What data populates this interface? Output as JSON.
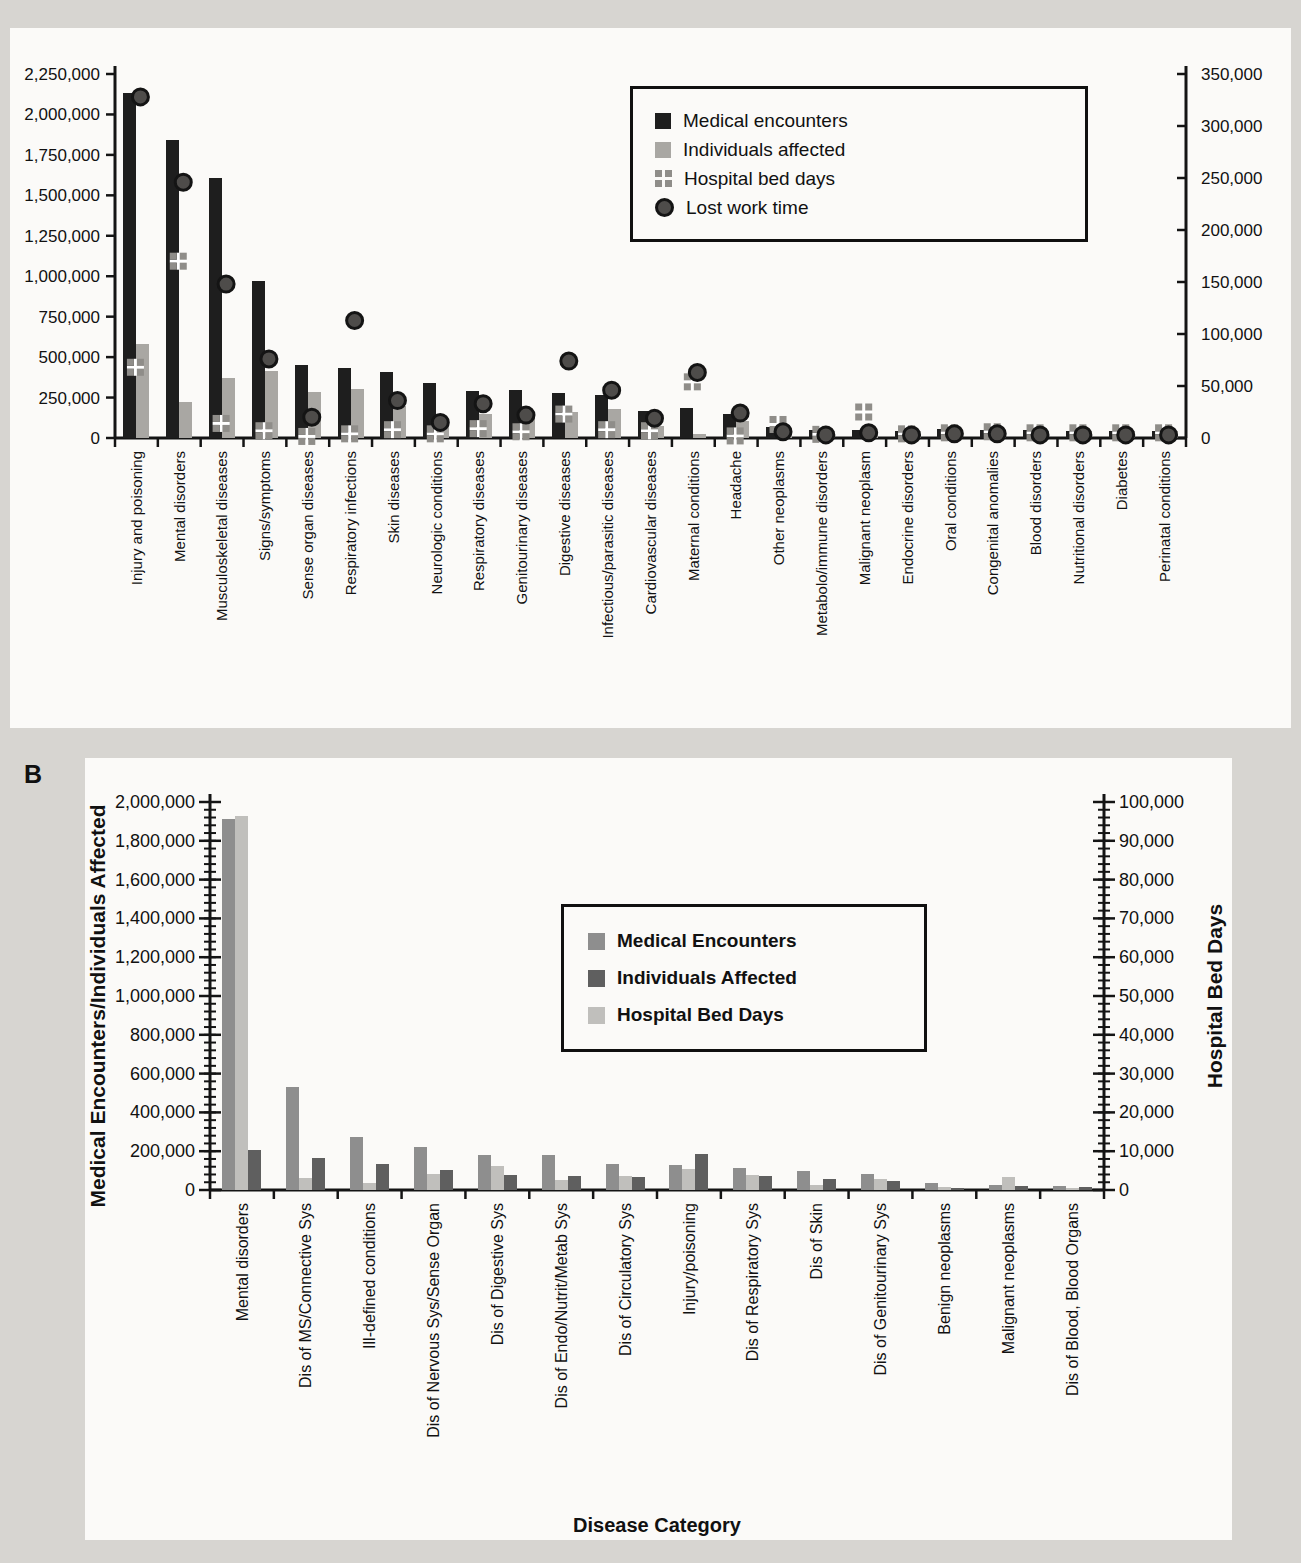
{
  "panels": {
    "a": {
      "label": "A"
    },
    "b": {
      "label": "B"
    }
  },
  "chart_data": [
    {
      "type": "bar",
      "panel": "A",
      "title": "",
      "categories": [
        "Injury and poisoning",
        "Mental disorders",
        "Musculoskeletal diseases",
        "Signs/symptoms",
        "Sense organ diseases",
        "Respiratory infections",
        "Skin diseases",
        "Neurologic conditions",
        "Respiratory diseases",
        "Genitourinary diseases",
        "Digestive diseases",
        "Infectious/parasitic diseases",
        "Cardiovascular diseases",
        "Maternal conditions",
        "Headache",
        "Other neoplasms",
        "Metabolo/immune disorders",
        "Malignant neoplasm",
        "Endocrine disorders",
        "Oral conditions",
        "Congenital anomalies",
        "Blood disorders",
        "Nutritional disorders",
        "Diabetes",
        "Perinatal conditions"
      ],
      "series": [
        {
          "name": "Medical encounters",
          "render": "bar",
          "axis": "left",
          "color": "#1e1e1e",
          "values": [
            2130000,
            1840000,
            1610000,
            970000,
            450000,
            435000,
            410000,
            340000,
            290000,
            295000,
            280000,
            265000,
            165000,
            185000,
            150000,
            70000,
            48000,
            52000,
            46000,
            56000,
            50000,
            52000,
            46000,
            46000,
            46000
          ]
        },
        {
          "name": "Individuals affected",
          "render": "bar",
          "axis": "left",
          "color": "#a9a7a3",
          "values": [
            580000,
            220000,
            372000,
            415000,
            282000,
            300000,
            195000,
            90000,
            150000,
            130000,
            160000,
            182000,
            76000,
            26000,
            103000,
            60000,
            42000,
            46000,
            42000,
            50000,
            46000,
            46000,
            42000,
            42000,
            42000
          ]
        },
        {
          "name": "Hospital bed days",
          "render": "checker",
          "axis": "right",
          "color": "#8f8d89",
          "values": [
            68000,
            170000,
            14000,
            7000,
            1500,
            4000,
            8000,
            4000,
            9000,
            6000,
            23000,
            8000,
            7000,
            54000,
            2000,
            13000,
            3500,
            25000,
            4000,
            5000,
            6000,
            5000,
            5000,
            5000,
            5000
          ]
        },
        {
          "name": "Lost work time",
          "render": "circle",
          "axis": "right",
          "color": "#4e4c4a",
          "values": [
            328000,
            246000,
            148000,
            76000,
            20000,
            113000,
            36000,
            15000,
            33000,
            22000,
            74000,
            46000,
            19000,
            63000,
            24000,
            6000,
            3000,
            5000,
            3000,
            4000,
            4000,
            3000,
            3000,
            3000,
            3000
          ]
        }
      ],
      "left_axis": {
        "min": 0,
        "max": 2250000,
        "step": 250000
      },
      "right_axis": {
        "min": 0,
        "max": 350000,
        "step": 50000
      },
      "legend_position": "top-right",
      "grid": false
    },
    {
      "type": "bar",
      "panel": "B",
      "title": "",
      "xlabel": "Disease Category",
      "categories": [
        "Mental disorders",
        "Dis of MS/Connective Sys",
        "Ill-defined conditions",
        "Dis of Nervous Sys/Sense Organ",
        "Dis of Digestive Sys",
        "Dis of Endo/Nutrit/Metab Sys",
        "Dis of Circulatory Sys",
        "Injury/poisoning",
        "Dis of Respiratory Sys",
        "Dis of Skin",
        "Dis of Genitourinary Sys",
        "Benign neoplasms",
        "Malignant neoplasms",
        "Dis of Blood, Blood Organs"
      ],
      "series": [
        {
          "name": "Medical Encounters",
          "render": "bar",
          "axis": "left",
          "color": "#8e8e8e",
          "values": [
            1910000,
            530000,
            272000,
            222000,
            178000,
            180000,
            133000,
            128000,
            113000,
            100000,
            80000,
            34000,
            25000,
            20000
          ]
        },
        {
          "name": "Individuals Affected",
          "render": "bar",
          "axis": "left",
          "color": "#5f5f5f",
          "values": [
            205000,
            165000,
            133000,
            105000,
            76000,
            70000,
            66000,
            186000,
            72000,
            55000,
            46000,
            12000,
            20000,
            13000
          ]
        },
        {
          "name": "Hospital Bed Days",
          "render": "bar",
          "axis": "right",
          "color": "#c0bfbc",
          "values": [
            96500,
            3100,
            1900,
            4000,
            6200,
            2500,
            3500,
            5500,
            3800,
            1200,
            2800,
            800,
            3400,
            600
          ]
        }
      ],
      "bar_visual_order": [
        0,
        2,
        1
      ],
      "left_axis": {
        "title": "Medical Encounters/Individuals Affected",
        "min": 0,
        "max": 2000000,
        "step": 200000,
        "minor_step": 40000
      },
      "right_axis": {
        "title": "Hospital Bed Days",
        "min": 0,
        "max": 100000,
        "step": 10000,
        "minor_step": 2000
      },
      "legend_position": "center",
      "grid": false
    }
  ]
}
